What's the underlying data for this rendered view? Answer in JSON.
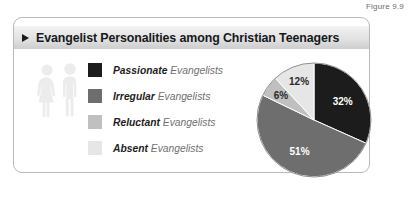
{
  "figure": {
    "caption": "Figure 9.9"
  },
  "card": {
    "title": "Evangelist Personalities among Christian Teenagers",
    "bullet_icon": "triangle-right-icon"
  },
  "people_icon": {
    "name": "two-people-icon",
    "color": "#ececec"
  },
  "legend": {
    "items": [
      {
        "label_strong": "Passionate",
        "label_soft": "Evangelists",
        "color": "#1c1c1c"
      },
      {
        "label_strong": "Irregular",
        "label_soft": "Evangelists",
        "color": "#6e6e6e"
      },
      {
        "label_strong": "Reluctant",
        "label_soft": "Evangelists",
        "color": "#c0c0c0"
      },
      {
        "label_strong": "Absent",
        "label_soft": "Evangelists",
        "color": "#e6e6e6"
      }
    ]
  },
  "chart_data": {
    "type": "pie",
    "title": "Evangelist Personalities among Christian Teenagers",
    "categories": [
      "Passionate Evangelists",
      "Irregular Evangelists",
      "Reluctant Evangelists",
      "Absent Evangelists"
    ],
    "values": [
      32,
      51,
      6,
      12
    ],
    "value_labels": [
      "32%",
      "51%",
      "6%",
      "12%"
    ],
    "colors": [
      "#1c1c1c",
      "#6e6e6e",
      "#c0c0c0",
      "#e6e6e6"
    ],
    "label_text_colors": [
      "#ffffff",
      "#ffffff",
      "#2a2a2a",
      "#2a2a2a"
    ],
    "start_angle_deg": 0,
    "direction": "clockwise",
    "legend_position": "left",
    "grid": false,
    "units": "percent"
  },
  "colors": {
    "card_border": "#b9b9b9",
    "title_band_top": "#f4f4f4",
    "title_band_bottom": "#cfcfcf",
    "page_background": "#ffffff",
    "caption_text": "#6b6b6b"
  }
}
